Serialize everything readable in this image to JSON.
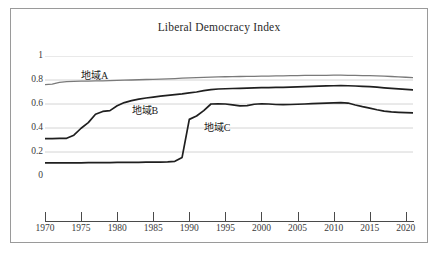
{
  "chart_data": {
    "type": "line",
    "title": "Liberal Democracy Index",
    "xlabel": "",
    "ylabel": "",
    "xlim": [
      1970,
      2021
    ],
    "ylim": [
      0,
      1
    ],
    "grid": "horizontal",
    "legend_position": "inline-labels",
    "yticks": [
      "0",
      "0.2",
      "0.4",
      "0.6",
      "0.8",
      "1"
    ],
    "ytick_values": [
      0,
      0.2,
      0.4,
      0.6,
      0.8,
      1
    ],
    "xticks": [
      "1970",
      "1975",
      "1980",
      "1985",
      "1990",
      "1995",
      "2000",
      "2005",
      "2010",
      "2015",
      "2020"
    ],
    "xtick_values": [
      1970,
      1975,
      1980,
      1985,
      1990,
      1995,
      2000,
      2005,
      2010,
      2015,
      2020
    ],
    "x": [
      1970,
      1971,
      1972,
      1973,
      1974,
      1975,
      1976,
      1977,
      1978,
      1979,
      1980,
      1981,
      1982,
      1983,
      1984,
      1985,
      1986,
      1987,
      1988,
      1989,
      1990,
      1991,
      1992,
      1993,
      1994,
      1995,
      1996,
      1997,
      1998,
      1999,
      2000,
      2001,
      2002,
      2003,
      2004,
      2005,
      2006,
      2007,
      2008,
      2009,
      2010,
      2011,
      2012,
      2013,
      2014,
      2015,
      2016,
      2017,
      2018,
      2019,
      2020,
      2021
    ],
    "series": [
      {
        "name": "地域A",
        "color": "#7a7a7a",
        "label_x": 1975,
        "label_y": 0.855,
        "values": [
          0.762,
          0.766,
          0.781,
          0.787,
          0.789,
          0.79,
          0.791,
          0.792,
          0.793,
          0.795,
          0.797,
          0.799,
          0.8,
          0.802,
          0.804,
          0.806,
          0.808,
          0.81,
          0.812,
          0.815,
          0.818,
          0.82,
          0.822,
          0.824,
          0.826,
          0.827,
          0.828,
          0.829,
          0.83,
          0.831,
          0.832,
          0.833,
          0.834,
          0.835,
          0.836,
          0.837,
          0.838,
          0.838,
          0.839,
          0.839,
          0.84,
          0.84,
          0.839,
          0.838,
          0.837,
          0.836,
          0.834,
          0.832,
          0.829,
          0.826,
          0.823,
          0.82
        ]
      },
      {
        "name": "地域B",
        "color": "#1f1f1f",
        "label_x": 1982,
        "label_y": 0.565,
        "values": [
          0.312,
          0.312,
          0.313,
          0.314,
          0.34,
          0.398,
          0.445,
          0.515,
          0.538,
          0.545,
          0.585,
          0.612,
          0.628,
          0.64,
          0.65,
          0.658,
          0.665,
          0.672,
          0.678,
          0.684,
          0.692,
          0.7,
          0.712,
          0.72,
          0.725,
          0.727,
          0.729,
          0.731,
          0.733,
          0.735,
          0.736,
          0.737,
          0.738,
          0.739,
          0.741,
          0.743,
          0.745,
          0.747,
          0.749,
          0.751,
          0.752,
          0.753,
          0.752,
          0.75,
          0.747,
          0.744,
          0.74,
          0.735,
          0.73,
          0.726,
          0.722,
          0.718
        ]
      },
      {
        "name": "地域C",
        "color": "#1f1f1f",
        "label_x": 1992,
        "label_y": 0.425,
        "values": [
          0.11,
          0.11,
          0.11,
          0.11,
          0.11,
          0.11,
          0.111,
          0.111,
          0.112,
          0.112,
          0.113,
          0.113,
          0.114,
          0.114,
          0.115,
          0.115,
          0.116,
          0.118,
          0.122,
          0.155,
          0.472,
          0.5,
          0.545,
          0.6,
          0.602,
          0.6,
          0.592,
          0.585,
          0.586,
          0.598,
          0.602,
          0.6,
          0.596,
          0.595,
          0.596,
          0.598,
          0.6,
          0.603,
          0.606,
          0.608,
          0.61,
          0.612,
          0.608,
          0.592,
          0.578,
          0.566,
          0.552,
          0.54,
          0.534,
          0.531,
          0.528,
          0.526
        ]
      }
    ]
  }
}
